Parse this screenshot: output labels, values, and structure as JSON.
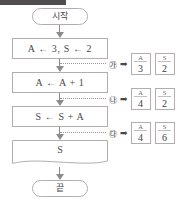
{
  "flowchart": {
    "start_label": "시작",
    "end_label": "끝",
    "steps": [
      {
        "id": "init",
        "text": "A ← 3, S ← 2"
      },
      {
        "id": "increment",
        "text": "A ← A + 1"
      },
      {
        "id": "accumulate",
        "text": "S ← S + A"
      }
    ],
    "output": {
      "id": "print-s",
      "text": "S"
    }
  },
  "annotations": [
    {
      "marker": "㉮",
      "arrow": "➡",
      "cells": [
        {
          "header": "A",
          "value": "3"
        },
        {
          "header": "S",
          "value": "2"
        }
      ]
    },
    {
      "marker": "㉯",
      "arrow": "➡",
      "cells": [
        {
          "header": "A",
          "value": "4"
        },
        {
          "header": "S",
          "value": "2"
        }
      ]
    },
    {
      "marker": "㉰",
      "arrow": "➡",
      "cells": [
        {
          "header": "A",
          "value": "4"
        },
        {
          "header": "S",
          "value": "6"
        }
      ]
    }
  ],
  "colors": {
    "border": "#b2aeaf",
    "text": "#4a4748",
    "arrow": "#8d8a8b",
    "band": "#4f4d4e"
  }
}
